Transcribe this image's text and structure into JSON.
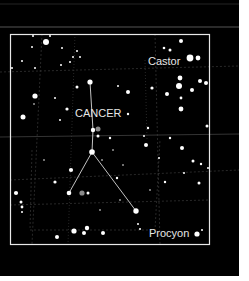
{
  "image": {
    "description": "Star chart of the constellation Cancer with neighboring bright stars",
    "background_color": "#000000",
    "frame_color": "#e8e8e8",
    "grid_color": "#3a3a3a",
    "star_color": "#ffffff",
    "line_color": "#d8d8d8"
  },
  "labels": {
    "constellation": "CANCER",
    "star_castor": "Castor",
    "star_procyon": "Procyon"
  }
}
